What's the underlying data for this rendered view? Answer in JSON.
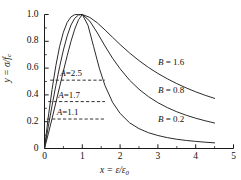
{
  "chart_data": {
    "type": "line",
    "title": "",
    "xlabel": "x = ε/ε₀",
    "ylabel": "y = σ/fᶜ",
    "xlim": [
      0,
      5
    ],
    "ylim": [
      0,
      1.0
    ],
    "grid": false,
    "legend_position": "inline-right",
    "xticks": [
      "0",
      "1",
      "2",
      "3",
      "4",
      "5"
    ],
    "xtick_values": [
      0,
      1,
      2,
      3,
      4,
      5
    ],
    "yticks": [
      "0",
      "0.2",
      "0.4",
      "0.6",
      "0.8",
      "1.0"
    ],
    "ytick_values": [
      0,
      0.2,
      0.4,
      0.6,
      0.8,
      1.0
    ],
    "x_minor_ticks": [
      0.5,
      1.5,
      2.5,
      3.5,
      4.5
    ],
    "y_minor_ticks": [
      0.1,
      0.3,
      0.5,
      0.7,
      0.9
    ],
    "series": [
      {
        "name": "B = 1.6",
        "descending_param": 1.6,
        "ascending_param": 2.5,
        "x": [
          0,
          0.1,
          0.2,
          0.3,
          0.4,
          0.5,
          0.6,
          0.7,
          0.8,
          0.9,
          1.0,
          1.2,
          1.4,
          1.6,
          1.8,
          2.0,
          2.25,
          2.5,
          2.75,
          3.0,
          3.25,
          3.5,
          3.75,
          4.0,
          4.25,
          4.5
        ],
        "y": [
          0,
          0.235,
          0.441,
          0.617,
          0.762,
          0.868,
          0.941,
          0.982,
          0.999,
          1.0,
          1.0,
          0.978,
          0.937,
          0.885,
          0.83,
          0.776,
          0.713,
          0.656,
          0.605,
          0.56,
          0.52,
          0.484,
          0.452,
          0.423,
          0.397,
          0.374
        ]
      },
      {
        "name": "B = 0.8",
        "descending_param": 0.8,
        "ascending_param": 1.7,
        "x": [
          0,
          0.1,
          0.2,
          0.3,
          0.4,
          0.5,
          0.6,
          0.7,
          0.8,
          0.9,
          1.0,
          1.2,
          1.4,
          1.6,
          1.8,
          2.0,
          2.25,
          2.5,
          2.75,
          3.0,
          3.25,
          3.5,
          3.75,
          4.0,
          4.25,
          4.5
        ],
        "y": [
          0,
          0.163,
          0.32,
          0.47,
          0.61,
          0.735,
          0.84,
          0.921,
          0.972,
          0.996,
          1.0,
          0.95,
          0.862,
          0.765,
          0.674,
          0.595,
          0.51,
          0.442,
          0.387,
          0.342,
          0.305,
          0.274,
          0.248,
          0.226,
          0.207,
          0.19
        ]
      },
      {
        "name": "B = 0.2",
        "descending_param": 0.2,
        "ascending_param": 1.1,
        "x": [
          0,
          0.1,
          0.2,
          0.3,
          0.4,
          0.5,
          0.6,
          0.7,
          0.8,
          0.9,
          1.0,
          1.15,
          1.3,
          1.45,
          1.6,
          1.8,
          2.0,
          2.25,
          2.5,
          2.75,
          3.0,
          3.25,
          3.5,
          3.75,
          4.0,
          4.25,
          4.5
        ],
        "y": [
          0,
          0.109,
          0.223,
          0.342,
          0.46,
          0.578,
          0.692,
          0.799,
          0.891,
          0.961,
          1.0,
          0.92,
          0.76,
          0.6,
          0.47,
          0.345,
          0.262,
          0.192,
          0.148,
          0.118,
          0.097,
          0.081,
          0.069,
          0.06,
          0.053,
          0.047,
          0.042
        ]
      }
    ],
    "annotations": [
      {
        "label": "A=2.5",
        "value": 2.5,
        "y_level": 0.51,
        "x_start": 0.15,
        "x_end": 1.6,
        "style": "dashed"
      },
      {
        "label": "A=1.7",
        "value": 1.7,
        "y_level": 0.35,
        "x_start": 0.1,
        "x_end": 1.6,
        "style": "dashed"
      },
      {
        "label": "A=1.1",
        "value": 1.1,
        "y_level": 0.22,
        "x_start": 0.06,
        "x_end": 1.6,
        "style": "dashed"
      }
    ],
    "curve_labels": [
      {
        "text": "B = 1.6",
        "x_pos": 3.0,
        "y_pos": 0.64
      },
      {
        "text": "B = 0.8",
        "x_pos": 3.0,
        "y_pos": 0.43
      },
      {
        "text": "B = 0.2",
        "x_pos": 3.0,
        "y_pos": 0.21
      }
    ]
  },
  "style": {
    "axis_color": "#1a1a1a",
    "curve_color": "#2b2b2b",
    "dash_color": "#1a1a1a",
    "background": "#ffffff"
  }
}
